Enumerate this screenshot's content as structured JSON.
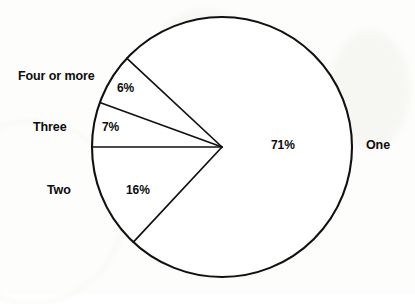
{
  "chart_data": {
    "type": "pie",
    "title": "",
    "subtitle": "",
    "xlabel": "",
    "ylabel": "",
    "legend_position": "none",
    "grid": false,
    "labels_inside": true,
    "categories": [
      "One",
      "Two",
      "Three",
      "Four or more"
    ],
    "values": [
      71,
      16,
      7,
      6
    ],
    "value_labels": [
      "71%",
      "16%",
      "7%",
      "6%"
    ],
    "slices": [
      {
        "name": "One",
        "label": "One",
        "value": 71,
        "value_label": "71%",
        "color": "#ffffff",
        "edge_color": "#111111",
        "start_angle_deg": 227,
        "end_angle_deg": 482,
        "label_side": "right"
      },
      {
        "name": "Two",
        "label": "Two",
        "value": 16,
        "value_label": "16%",
        "color": "#ffffff",
        "edge_color": "#111111",
        "start_angle_deg": 180,
        "end_angle_deg": 227,
        "label_side": "left"
      },
      {
        "name": "Three",
        "label": "Three",
        "value": 7,
        "value_label": "7%",
        "color": "#ffffff",
        "edge_color": "#111111",
        "start_angle_deg": 160,
        "end_angle_deg": 180,
        "label_side": "left"
      },
      {
        "name": "Four or more",
        "label": "Four or more",
        "value": 6,
        "value_label": "6%",
        "color": "#ffffff",
        "edge_color": "#111111",
        "start_angle_deg": 137,
        "end_angle_deg": 160,
        "label_side": "left"
      }
    ],
    "total": 100,
    "units": "percent"
  },
  "geometry": {
    "center_x": 222,
    "center_y": 147,
    "radius": 130
  },
  "style": {
    "background": "#fdfdfb",
    "line_color": "#111111",
    "text_color": "#0d0d0d"
  }
}
